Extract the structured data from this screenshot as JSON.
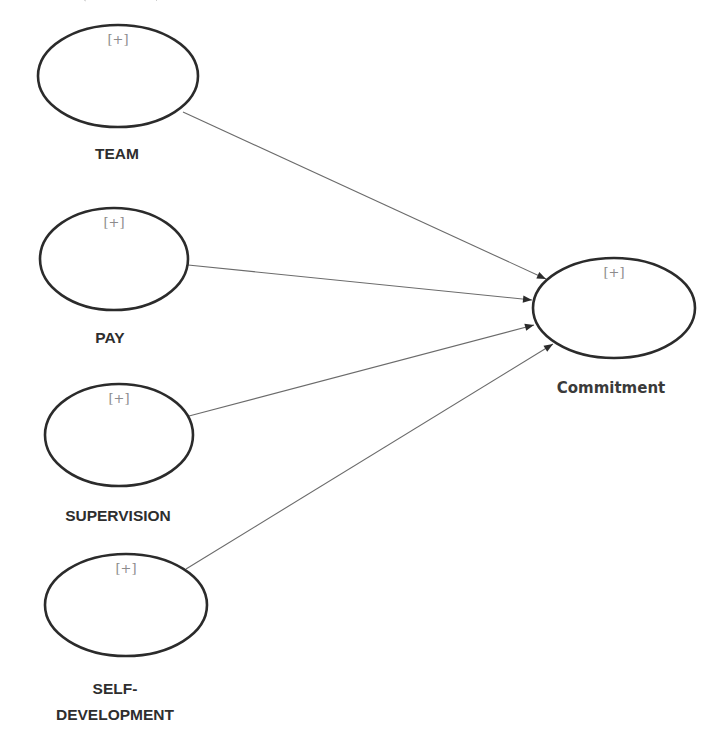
{
  "diagram": {
    "type": "path-model",
    "expand_marker": "[+]",
    "nodes": [
      {
        "id": "team",
        "label": "TEAM",
        "label_lines": [
          "TEAM"
        ],
        "role": "exogenous",
        "cx": 118,
        "cy": 76,
        "rx": 80,
        "ry": 51,
        "label_y": [
          159
        ]
      },
      {
        "id": "pay",
        "label": "PAY",
        "label_lines": [
          "PAY"
        ],
        "role": "exogenous",
        "cx": 114,
        "cy": 259,
        "rx": 74,
        "ry": 51,
        "label_y": [
          343
        ]
      },
      {
        "id": "supervision",
        "label": "SUPERVISION",
        "label_lines": [
          "SUPERVISION"
        ],
        "role": "exogenous",
        "cx": 119,
        "cy": 435,
        "rx": 74,
        "ry": 51,
        "label_y": [
          521
        ]
      },
      {
        "id": "self-development",
        "label": "SELF-DEVELOPMENT",
        "label_lines": [
          "SELF-",
          "DEVELOPMENT"
        ],
        "role": "exogenous",
        "cx": 126,
        "cy": 605,
        "rx": 81,
        "ry": 51,
        "label_y": [
          694,
          720
        ]
      },
      {
        "id": "commitment",
        "label": "Commitment",
        "label_lines": [
          "Commitment"
        ],
        "role": "endogenous",
        "cx": 614,
        "cy": 308,
        "rx": 81,
        "ry": 50,
        "label_y": [
          393
        ]
      }
    ],
    "edges": [
      {
        "from": "team",
        "to": "commitment",
        "x1": 183,
        "y1": 112,
        "x2": 546,
        "y2": 279
      },
      {
        "from": "pay",
        "to": "commitment",
        "x1": 188,
        "y1": 265,
        "x2": 532,
        "y2": 300
      },
      {
        "from": "supervision",
        "to": "commitment",
        "x1": 189,
        "y1": 416,
        "x2": 534,
        "y2": 325
      },
      {
        "from": "self-development",
        "to": "commitment",
        "x1": 186,
        "y1": 569,
        "x2": 553,
        "y2": 344
      }
    ]
  }
}
